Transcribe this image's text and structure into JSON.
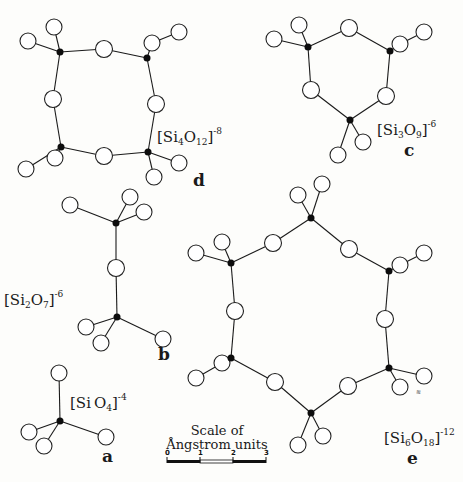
{
  "colors": {
    "background": "#fdfdfb",
    "ink": "#1a1a1a",
    "silicon": "#0d0d0d",
    "oxygen_fill": "#ffffff"
  },
  "structures": [
    {
      "id": "a",
      "letter": "a",
      "formula": {
        "bracket_open": "[",
        "si": "Si",
        "si_n": "",
        "o": "O",
        "o_n": "4",
        "bracket_close": "]",
        "charge": "-4"
      },
      "silicon": [
        [
          60,
          421
        ]
      ],
      "oxygen_bridging": [],
      "oxygen_terminal": [
        [
          59,
          373
        ],
        [
          29,
          432
        ],
        [
          44,
          446
        ],
        [
          106,
          437
        ]
      ],
      "bonds": [
        [
          [
            60,
            421
          ],
          [
            59,
            373
          ]
        ],
        [
          [
            60,
            421
          ],
          [
            29,
            432
          ]
        ],
        [
          [
            60,
            421
          ],
          [
            44,
            446
          ]
        ],
        [
          [
            60,
            421
          ],
          [
            106,
            437
          ]
        ]
      ]
    },
    {
      "id": "b",
      "letter": "b",
      "formula": {
        "bracket_open": "[",
        "si": "Si",
        "si_n": "2",
        "o": "O",
        "o_n": "7",
        "bracket_close": "]",
        "charge": "-6"
      },
      "silicon": [
        [
          116,
          223
        ],
        [
          117,
          317
        ]
      ],
      "oxygen_bridging": [
        [
          116,
          268
        ]
      ],
      "oxygen_terminal": [
        [
          70,
          205
        ],
        [
          130,
          197
        ],
        [
          144,
          212
        ],
        [
          86,
          327
        ],
        [
          101,
          343
        ],
        [
          163,
          339
        ]
      ],
      "bonds": [
        [
          [
            116,
            223
          ],
          [
            116,
            268
          ]
        ],
        [
          [
            116,
            268
          ],
          [
            117,
            317
          ]
        ],
        [
          [
            116,
            223
          ],
          [
            70,
            205
          ]
        ],
        [
          [
            116,
            223
          ],
          [
            130,
            197
          ]
        ],
        [
          [
            116,
            223
          ],
          [
            144,
            212
          ]
        ],
        [
          [
            117,
            317
          ],
          [
            86,
            327
          ]
        ],
        [
          [
            117,
            317
          ],
          [
            101,
            343
          ]
        ],
        [
          [
            117,
            317
          ],
          [
            163,
            339
          ]
        ]
      ]
    },
    {
      "id": "c",
      "letter": "c",
      "formula": {
        "bracket_open": "[",
        "si": "Si",
        "si_n": "3",
        "o": "O",
        "o_n": "9",
        "bracket_close": "]",
        "charge": "-6"
      },
      "silicon": [
        [
          308,
          47
        ],
        [
          390,
          51
        ],
        [
          350,
          120
        ]
      ],
      "oxygen_bridging": [
        [
          349,
          28
        ],
        [
          311,
          90
        ],
        [
          386,
          96
        ]
      ],
      "oxygen_terminal": [
        [
          274,
          39
        ],
        [
          299,
          25
        ],
        [
          400,
          44
        ],
        [
          424,
          32
        ],
        [
          338,
          155
        ],
        [
          363,
          142
        ]
      ],
      "bonds": [
        [
          [
            308,
            47
          ],
          [
            349,
            28
          ]
        ],
        [
          [
            349,
            28
          ],
          [
            390,
            51
          ]
        ],
        [
          [
            390,
            51
          ],
          [
            386,
            96
          ]
        ],
        [
          [
            386,
            96
          ],
          [
            350,
            120
          ]
        ],
        [
          [
            350,
            120
          ],
          [
            311,
            90
          ]
        ],
        [
          [
            311,
            90
          ],
          [
            308,
            47
          ]
        ],
        [
          [
            308,
            47
          ],
          [
            274,
            39
          ]
        ],
        [
          [
            308,
            47
          ],
          [
            299,
            25
          ]
        ],
        [
          [
            390,
            51
          ],
          [
            400,
            44
          ]
        ],
        [
          [
            400,
            44
          ],
          [
            424,
            32
          ]
        ],
        [
          [
            350,
            120
          ],
          [
            338,
            155
          ]
        ],
        [
          [
            350,
            120
          ],
          [
            363,
            142
          ]
        ]
      ]
    },
    {
      "id": "d",
      "letter": "d",
      "formula": {
        "bracket_open": "[",
        "si": "Si",
        "si_n": "4",
        "o": "O",
        "o_n": "12",
        "bracket_close": "]",
        "charge": "-8"
      },
      "silicon": [
        [
          60,
          52
        ],
        [
          147,
          58
        ],
        [
          61,
          147
        ],
        [
          148,
          152
        ]
      ],
      "oxygen_bridging": [
        [
          104,
          49
        ],
        [
          53,
          99
        ],
        [
          156,
          104
        ],
        [
          104,
          156
        ]
      ],
      "oxygen_terminal": [
        [
          28,
          41
        ],
        [
          54,
          27
        ],
        [
          152,
          43
        ],
        [
          179,
          32
        ],
        [
          26,
          169
        ],
        [
          55,
          158
        ],
        [
          179,
          163
        ],
        [
          154,
          177
        ]
      ],
      "bonds": [
        [
          [
            60,
            52
          ],
          [
            104,
            49
          ]
        ],
        [
          [
            104,
            49
          ],
          [
            147,
            58
          ]
        ],
        [
          [
            147,
            58
          ],
          [
            156,
            104
          ]
        ],
        [
          [
            156,
            104
          ],
          [
            148,
            152
          ]
        ],
        [
          [
            148,
            152
          ],
          [
            104,
            156
          ]
        ],
        [
          [
            104,
            156
          ],
          [
            61,
            147
          ]
        ],
        [
          [
            61,
            147
          ],
          [
            53,
            99
          ]
        ],
        [
          [
            53,
            99
          ],
          [
            60,
            52
          ]
        ],
        [
          [
            60,
            52
          ],
          [
            28,
            41
          ]
        ],
        [
          [
            60,
            52
          ],
          [
            54,
            27
          ]
        ],
        [
          [
            147,
            58
          ],
          [
            152,
            43
          ]
        ],
        [
          [
            152,
            43
          ],
          [
            179,
            32
          ]
        ],
        [
          [
            61,
            147
          ],
          [
            26,
            169
          ]
        ],
        [
          [
            61,
            147
          ],
          [
            55,
            158
          ]
        ],
        [
          [
            148,
            152
          ],
          [
            179,
            163
          ]
        ],
        [
          [
            148,
            152
          ],
          [
            154,
            177
          ]
        ]
      ]
    },
    {
      "id": "e",
      "letter": "e",
      "formula": {
        "bracket_open": "[",
        "si": "Si",
        "si_n": "6",
        "o": "O",
        "o_n": "18",
        "bracket_close": "]",
        "charge": "-12"
      },
      "silicon": [
        [
          311,
          218
        ],
        [
          231,
          263
        ],
        [
          389,
          271
        ],
        [
          231,
          358
        ],
        [
          389,
          368
        ],
        [
          311,
          413
        ]
      ],
      "oxygen_bridging": [
        [
          273,
          243
        ],
        [
          349,
          249
        ],
        [
          235,
          311
        ],
        [
          385,
          319
        ],
        [
          275,
          382
        ],
        [
          348,
          386
        ]
      ],
      "oxygen_terminal": [
        [
          298,
          195
        ],
        [
          322,
          184
        ],
        [
          196,
          253
        ],
        [
          222,
          242
        ],
        [
          400,
          265
        ],
        [
          424,
          253
        ],
        [
          196,
          378
        ],
        [
          222,
          363
        ],
        [
          400,
          387
        ],
        [
          424,
          376
        ],
        [
          298,
          445
        ],
        [
          323,
          436
        ]
      ],
      "bonds": [
        [
          [
            311,
            218
          ],
          [
            273,
            243
          ]
        ],
        [
          [
            273,
            243
          ],
          [
            231,
            263
          ]
        ],
        [
          [
            231,
            263
          ],
          [
            235,
            311
          ]
        ],
        [
          [
            235,
            311
          ],
          [
            231,
            358
          ]
        ],
        [
          [
            231,
            358
          ],
          [
            275,
            382
          ]
        ],
        [
          [
            275,
            382
          ],
          [
            311,
            413
          ]
        ],
        [
          [
            311,
            413
          ],
          [
            348,
            386
          ]
        ],
        [
          [
            348,
            386
          ],
          [
            389,
            368
          ]
        ],
        [
          [
            389,
            368
          ],
          [
            385,
            319
          ]
        ],
        [
          [
            385,
            319
          ],
          [
            389,
            271
          ]
        ],
        [
          [
            389,
            271
          ],
          [
            349,
            249
          ]
        ],
        [
          [
            349,
            249
          ],
          [
            311,
            218
          ]
        ],
        [
          [
            311,
            218
          ],
          [
            298,
            195
          ]
        ],
        [
          [
            311,
            218
          ],
          [
            322,
            184
          ]
        ],
        [
          [
            231,
            263
          ],
          [
            196,
            253
          ]
        ],
        [
          [
            231,
            263
          ],
          [
            222,
            242
          ]
        ],
        [
          [
            389,
            271
          ],
          [
            400,
            265
          ]
        ],
        [
          [
            400,
            265
          ],
          [
            424,
            253
          ]
        ],
        [
          [
            231,
            358
          ],
          [
            196,
            378
          ]
        ],
        [
          [
            231,
            358
          ],
          [
            222,
            363
          ]
        ],
        [
          [
            389,
            368
          ],
          [
            400,
            387
          ]
        ],
        [
          [
            389,
            368
          ],
          [
            424,
            376
          ]
        ],
        [
          [
            311,
            413
          ],
          [
            298,
            445
          ]
        ],
        [
          [
            311,
            413
          ],
          [
            323,
            436
          ]
        ]
      ]
    }
  ],
  "labels": {
    "a": {
      "formula_pos": [
        70,
        393
      ],
      "letter_pos": [
        102,
        448
      ]
    },
    "b": {
      "formula_pos": [
        4,
        290
      ],
      "letter_pos": [
        158,
        346
      ]
    },
    "c": {
      "formula_pos": [
        377,
        120
      ],
      "letter_pos": [
        404,
        142
      ]
    },
    "d": {
      "formula_pos": [
        157,
        127
      ],
      "letter_pos": [
        193,
        172
      ]
    },
    "e": {
      "formula_pos": [
        384,
        428
      ],
      "letter_pos": [
        407,
        450
      ]
    }
  },
  "scale": {
    "title_line1": "Scale of",
    "title_line2": "Ångstrom units",
    "ticks": [
      "0",
      "1",
      "2",
      "3"
    ],
    "bar_x": 167,
    "bar_y": 460,
    "unit_px": 33
  },
  "mark_near_e": "≋"
}
